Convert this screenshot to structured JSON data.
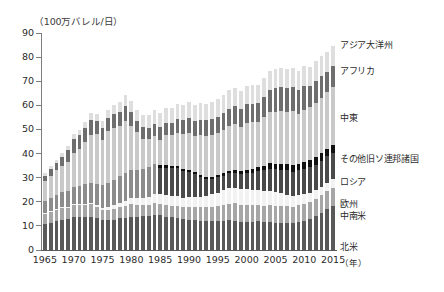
{
  "chart_data": {
    "type": "bar",
    "stacked": true,
    "title": "（100万バレル/日）",
    "xlabel": "（年）",
    "ylabel": "",
    "ylim": [
      0,
      90
    ],
    "ytick_step": 10,
    "yticks": [
      0,
      10,
      20,
      30,
      40,
      50,
      60,
      70,
      80,
      90
    ],
    "xtick_labels": [
      "1965",
      "1970",
      "1975",
      "1980",
      "1985",
      "1990",
      "1995",
      "2000",
      "2005",
      "2010",
      "2015"
    ],
    "grid": false,
    "legend_position": "right-inline",
    "categories": [
      1965,
      1966,
      1967,
      1968,
      1969,
      1970,
      1971,
      1972,
      1973,
      1974,
      1975,
      1976,
      1977,
      1978,
      1979,
      1980,
      1981,
      1982,
      1983,
      1984,
      1985,
      1986,
      1987,
      1988,
      1989,
      1990,
      1991,
      1992,
      1993,
      1994,
      1995,
      1996,
      1997,
      1998,
      1999,
      2000,
      2001,
      2002,
      2003,
      2004,
      2005,
      2006,
      2007,
      2008,
      2009,
      2010,
      2011,
      2012,
      2013,
      2014,
      2015
    ],
    "series": [
      {
        "name": "北米",
        "color": "#595959",
        "values": [
          10.6,
          11.1,
          12.0,
          12.5,
          12.8,
          13.8,
          13.6,
          13.8,
          13.8,
          13.2,
          12.5,
          12.3,
          12.6,
          13.2,
          13.4,
          13.9,
          13.9,
          14.0,
          14.2,
          14.5,
          14.5,
          13.9,
          13.5,
          13.4,
          12.7,
          12.4,
          12.5,
          12.2,
          12.0,
          12.0,
          11.9,
          12.1,
          12.3,
          12.2,
          11.8,
          11.7,
          11.7,
          11.9,
          11.8,
          11.7,
          11.4,
          11.4,
          11.4,
          11.2,
          11.8,
          12.2,
          12.9,
          14.0,
          15.5,
          17.1,
          18.2
        ]
      },
      {
        "name": "中南米",
        "color": "#a6a6a6",
        "values": [
          4.4,
          4.5,
          4.7,
          4.8,
          4.8,
          5.0,
          5.0,
          5.0,
          5.2,
          4.8,
          4.3,
          4.5,
          4.6,
          4.6,
          4.9,
          5.0,
          4.7,
          4.6,
          4.6,
          4.8,
          4.7,
          4.8,
          4.8,
          5.0,
          5.1,
          5.3,
          5.4,
          5.6,
          5.8,
          6.0,
          6.3,
          6.6,
          6.9,
          7.1,
          6.9,
          6.9,
          6.8,
          6.6,
          6.5,
          6.8,
          6.9,
          6.9,
          6.7,
          6.7,
          6.7,
          7.0,
          7.1,
          7.2,
          7.3,
          7.4,
          7.5
        ]
      },
      {
        "name": "欧州",
        "color": "#f2f2f2",
        "values": [
          0.4,
          0.4,
          0.4,
          0.4,
          0.4,
          0.4,
          0.4,
          0.4,
          0.5,
          0.5,
          0.6,
          0.9,
          1.3,
          1.8,
          2.2,
          2.5,
          2.8,
          3.0,
          3.4,
          3.9,
          4.1,
          4.2,
          4.2,
          4.1,
          3.8,
          4.1,
          4.3,
          4.4,
          4.6,
          5.2,
          5.6,
          6.1,
          6.4,
          6.5,
          6.6,
          6.7,
          6.6,
          6.5,
          6.3,
          6.0,
          5.6,
          5.2,
          4.9,
          4.6,
          4.4,
          4.1,
          3.8,
          3.6,
          3.5,
          3.5,
          3.6
        ]
      },
      {
        "name": "ロシア",
        "color": "#4a4a4a",
        "values": [
          0,
          0,
          0,
          0,
          0,
          0,
          0,
          0,
          0,
          0,
          0,
          0,
          0,
          0,
          0,
          0,
          0,
          0,
          0,
          0,
          10.9,
          11.2,
          11.4,
          11.4,
          11.1,
          10.4,
          9.3,
          8.0,
          7.1,
          6.4,
          6.3,
          6.1,
          6.2,
          6.2,
          6.2,
          6.5,
          7.0,
          7.7,
          8.5,
          9.3,
          9.6,
          9.8,
          10.0,
          10.0,
          10.1,
          10.3,
          10.5,
          10.6,
          10.8,
          10.9,
          11.0
        ]
      },
      {
        "name": "その他旧ソ連邦諸国",
        "color": "#111111",
        "values": [
          0,
          0,
          0,
          0,
          0,
          0,
          0,
          0,
          0,
          0,
          0,
          0,
          0,
          0,
          0,
          0,
          0,
          0,
          0,
          0,
          1.0,
          1.0,
          1.0,
          1.0,
          1.0,
          1.0,
          1.0,
          0.9,
          0.9,
          0.9,
          0.9,
          0.9,
          0.9,
          1.0,
          1.1,
          1.3,
          1.5,
          1.7,
          1.9,
          2.1,
          2.3,
          2.5,
          2.7,
          2.8,
          2.9,
          3.0,
          3.0,
          3.0,
          3.1,
          3.1,
          3.2
        ]
      },
      {
        "name": "旧ソ連",
        "color": "#8c8c8c",
        "values": [
          4.9,
          5.4,
          5.8,
          6.2,
          6.6,
          7.1,
          7.5,
          8.0,
          8.4,
          9.0,
          9.5,
          10.0,
          10.6,
          11.1,
          11.4,
          11.7,
          11.9,
          12.0,
          12.2,
          12.3,
          0,
          0,
          0,
          0,
          0,
          0,
          0,
          0,
          0,
          0,
          0,
          0,
          0,
          0,
          0,
          0,
          0,
          0,
          0,
          0,
          0,
          0,
          0,
          0,
          0,
          0,
          0,
          0,
          0,
          0,
          0
        ]
      },
      {
        "name": "中東",
        "color": "#c9c9c9",
        "values": [
          8.4,
          9.4,
          10.1,
          11.1,
          12.1,
          13.9,
          15.5,
          17.5,
          20.0,
          20.6,
          18.7,
          21.5,
          21.6,
          20.7,
          21.6,
          18.2,
          15.5,
          12.5,
          11.6,
          11.8,
          10.4,
          12.5,
          12.7,
          13.8,
          14.4,
          15.4,
          14.7,
          16.5,
          17.0,
          17.2,
          17.6,
          18.0,
          18.6,
          19.3,
          18.5,
          19.5,
          19.3,
          18.5,
          20.1,
          21.2,
          21.6,
          21.8,
          21.5,
          22.2,
          20.7,
          21.4,
          21.9,
          22.6,
          23.0,
          23.4,
          24.3
        ]
      },
      {
        "name": "アフリカ",
        "color": "#6e6e6e",
        "values": [
          2.2,
          2.8,
          3.1,
          3.7,
          4.6,
          5.9,
          5.6,
          5.8,
          5.9,
          5.4,
          4.9,
          5.5,
          5.9,
          5.9,
          6.4,
          6.1,
          4.8,
          4.9,
          4.8,
          5.1,
          5.3,
          5.3,
          5.3,
          5.5,
          5.7,
          6.2,
          6.3,
          6.4,
          6.4,
          6.6,
          6.7,
          7.0,
          7.4,
          7.5,
          7.4,
          7.8,
          7.8,
          7.9,
          8.3,
          9.3,
          9.8,
          9.9,
          9.9,
          10.0,
          9.6,
          10.1,
          8.7,
          9.3,
          8.8,
          8.4,
          8.4
        ]
      },
      {
        "name": "アジア大洋州",
        "color": "#dedede",
        "values": [
          1.0,
          1.2,
          1.4,
          1.6,
          1.8,
          2.1,
          2.3,
          2.6,
          2.9,
          3.0,
          3.1,
          3.4,
          3.7,
          4.0,
          4.3,
          4.4,
          4.6,
          4.9,
          5.3,
          5.6,
          5.8,
          6.0,
          6.1,
          6.3,
          6.4,
          6.6,
          6.7,
          6.8,
          6.9,
          7.0,
          7.2,
          7.4,
          7.6,
          7.6,
          7.5,
          7.7,
          7.7,
          7.7,
          7.8,
          7.9,
          7.9,
          7.9,
          7.9,
          8.0,
          8.0,
          8.2,
          8.2,
          8.3,
          8.3,
          8.4,
          8.4
        ]
      }
    ],
    "legend_entries": [
      {
        "label": "アジア大洋州",
        "top": 40
      },
      {
        "label": "アフリカ",
        "top": 66
      },
      {
        "label": "中東",
        "top": 113
      },
      {
        "label": "その他旧ソ連邦諸国",
        "top": 154
      },
      {
        "label": "ロシア",
        "top": 177
      },
      {
        "label": "欧州",
        "top": 199
      },
      {
        "label": "中南米",
        "top": 211
      },
      {
        "label": "北米",
        "top": 242
      }
    ]
  }
}
